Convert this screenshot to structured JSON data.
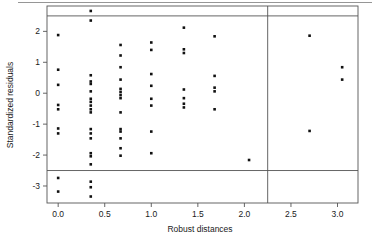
{
  "chart_data": {
    "type": "scatter",
    "title": "",
    "xlabel": "Robust distances",
    "ylabel": "Standardized residuals",
    "xlim": [
      -0.12,
      3.22
    ],
    "ylim": [
      -3.55,
      2.82
    ],
    "grid": false,
    "legend": "none",
    "xticks": [
      0.0,
      0.5,
      1.0,
      1.5,
      2.0,
      2.5,
      3.0
    ],
    "xtick_labels": [
      "0.0",
      "0.5",
      "1.0",
      "1.5",
      "2.0",
      "2.5",
      "3.0"
    ],
    "yticks": [
      2,
      1,
      0,
      -1,
      -2,
      -3
    ],
    "ytick_labels": [
      "2",
      "1",
      "0",
      "-1",
      "-2",
      "-3"
    ],
    "reference_lines": {
      "horizontal": [
        2.5,
        -2.5
      ],
      "vertical": [
        2.25
      ]
    },
    "point_color": "#111111",
    "line_color": "#555555",
    "points": [
      {
        "x": 0.0,
        "y": 1.88
      },
      {
        "x": 0.0,
        "y": 0.76
      },
      {
        "x": 0.0,
        "y": 0.27
      },
      {
        "x": 0.0,
        "y": -0.38
      },
      {
        "x": 0.0,
        "y": -0.52
      },
      {
        "x": 0.0,
        "y": -1.14
      },
      {
        "x": 0.0,
        "y": -1.3
      },
      {
        "x": 0.0,
        "y": -2.74
      },
      {
        "x": 0.0,
        "y": -3.18
      },
      {
        "x": 0.35,
        "y": 2.66
      },
      {
        "x": 0.35,
        "y": 2.35
      },
      {
        "x": 0.35,
        "y": 0.58
      },
      {
        "x": 0.35,
        "y": 0.38
      },
      {
        "x": 0.35,
        "y": 0.3
      },
      {
        "x": 0.35,
        "y": 0.06
      },
      {
        "x": 0.35,
        "y": -0.18
      },
      {
        "x": 0.35,
        "y": -0.28
      },
      {
        "x": 0.35,
        "y": -0.4
      },
      {
        "x": 0.35,
        "y": -0.52
      },
      {
        "x": 0.35,
        "y": -0.62
      },
      {
        "x": 0.35,
        "y": -1.16
      },
      {
        "x": 0.35,
        "y": -1.3
      },
      {
        "x": 0.35,
        "y": -1.46
      },
      {
        "x": 0.35,
        "y": -1.94
      },
      {
        "x": 0.35,
        "y": -2.04
      },
      {
        "x": 0.35,
        "y": -2.3
      },
      {
        "x": 0.35,
        "y": -2.86
      },
      {
        "x": 0.35,
        "y": -3.04
      },
      {
        "x": 0.35,
        "y": -3.34
      },
      {
        "x": 0.67,
        "y": 1.56
      },
      {
        "x": 0.67,
        "y": 1.22
      },
      {
        "x": 0.67,
        "y": 0.84
      },
      {
        "x": 0.67,
        "y": 0.44
      },
      {
        "x": 0.67,
        "y": 0.14
      },
      {
        "x": 0.67,
        "y": 0.04
      },
      {
        "x": 0.67,
        "y": -0.06
      },
      {
        "x": 0.67,
        "y": -0.16
      },
      {
        "x": 0.67,
        "y": -0.62
      },
      {
        "x": 0.67,
        "y": -1.16
      },
      {
        "x": 0.67,
        "y": -1.24
      },
      {
        "x": 0.67,
        "y": -1.46
      },
      {
        "x": 0.67,
        "y": -1.78
      },
      {
        "x": 0.67,
        "y": -2.02
      },
      {
        "x": 1.0,
        "y": 1.64
      },
      {
        "x": 1.0,
        "y": 1.4
      },
      {
        "x": 1.0,
        "y": 0.62
      },
      {
        "x": 1.0,
        "y": 0.24
      },
      {
        "x": 1.0,
        "y": -0.18
      },
      {
        "x": 1.0,
        "y": -0.4
      },
      {
        "x": 1.0,
        "y": -1.24
      },
      {
        "x": 1.0,
        "y": -1.94
      },
      {
        "x": 1.35,
        "y": 2.12
      },
      {
        "x": 1.35,
        "y": 1.42
      },
      {
        "x": 1.35,
        "y": 1.3
      },
      {
        "x": 1.35,
        "y": 0.12
      },
      {
        "x": 1.35,
        "y": -0.16
      },
      {
        "x": 1.35,
        "y": -0.34
      },
      {
        "x": 1.35,
        "y": -0.46
      },
      {
        "x": 1.68,
        "y": 1.84
      },
      {
        "x": 1.68,
        "y": 0.56
      },
      {
        "x": 1.68,
        "y": 0.18
      },
      {
        "x": 1.68,
        "y": 0.06
      },
      {
        "x": 1.68,
        "y": -0.52
      },
      {
        "x": 2.05,
        "y": -2.16
      },
      {
        "x": 2.7,
        "y": 1.86
      },
      {
        "x": 2.7,
        "y": -1.22
      },
      {
        "x": 3.05,
        "y": 0.84
      },
      {
        "x": 3.05,
        "y": 0.44
      }
    ]
  },
  "axes": {
    "x_title": "Robust distances",
    "y_title": "Standardized residuals"
  }
}
